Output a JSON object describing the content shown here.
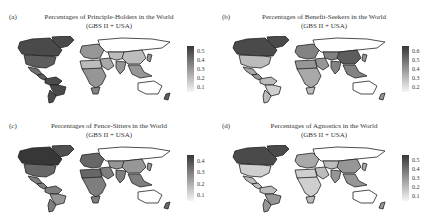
{
  "chart_data": [
    {
      "type": "heatmap",
      "subtype": "choropleth-world-map",
      "panel_label": "(a)",
      "title": "Percentages of Principle-Holders in the World",
      "subtitle": "(GBS II + USA)",
      "colorbar": {
        "ticks": [
          "0.5",
          "0.4",
          "0.3",
          "0.2",
          "0.1"
        ],
        "range": [
          0.05,
          0.55
        ],
        "colormap": "grayscale (light=low, dark=high)"
      },
      "regions": {
        "greenland": 0.5,
        "canada": 0.5,
        "usa": 0.45,
        "mexico": 0.4,
        "central_america": 0.45,
        "south_america_north": 0.5,
        "brazil": 0.5,
        "south_america_south": 0.5,
        "europe": 0.3,
        "russia": null,
        "middle_east": 0.25,
        "north_africa": 0.2,
        "sub_saharan_africa": 0.3,
        "south_africa": 0.35,
        "central_asia": 0.2,
        "china": 0.2,
        "india": 0.3,
        "southeast_asia": 0.3,
        "japan": 0.3,
        "australia": null,
        "new_zealand": 0.45
      }
    },
    {
      "type": "heatmap",
      "subtype": "choropleth-world-map",
      "panel_label": "(b)",
      "title": "Percentages of Benefit-Seekers in the World",
      "subtitle": "(GBS II + USA)",
      "colorbar": {
        "ticks": [
          "0.6",
          "0.5",
          "0.4",
          "0.3",
          "0.2"
        ],
        "range": [
          0.15,
          0.65
        ],
        "colormap": "grayscale (light=low, dark=high)"
      },
      "regions": {
        "greenland": 0.6,
        "canada": 0.6,
        "usa": 0.3,
        "mexico": 0.35,
        "central_america": 0.4,
        "south_america_north": 0.3,
        "brazil": 0.25,
        "south_america_south": 0.3,
        "europe": 0.45,
        "russia": null,
        "middle_east": 0.4,
        "north_africa": 0.4,
        "sub_saharan_africa": 0.35,
        "south_africa": 0.3,
        "central_asia": 0.45,
        "china": 0.55,
        "india": 0.45,
        "southeast_asia": 0.45,
        "japan": 0.4,
        "australia": null,
        "new_zealand": 0.4
      }
    },
    {
      "type": "heatmap",
      "subtype": "choropleth-world-map",
      "panel_label": "(c)",
      "title": "Percentages of Fence-Sitters in the World",
      "subtitle": "(GBS II + USA)",
      "colorbar": {
        "ticks": [
          "0.4",
          "0.3",
          "0.2",
          "0.1"
        ],
        "range": [
          0.05,
          0.45
        ],
        "colormap": "grayscale (light=low, dark=high)"
      },
      "regions": {
        "greenland": 0.4,
        "canada": 0.45,
        "usa": 0.35,
        "mexico": 0.3,
        "central_america": 0.3,
        "south_america_north": 0.3,
        "brazil": 0.25,
        "south_america_south": 0.3,
        "europe": 0.35,
        "russia": null,
        "middle_east": 0.3,
        "north_africa": 0.35,
        "sub_saharan_africa": 0.3,
        "south_africa": 0.3,
        "central_asia": 0.25,
        "china": 0.25,
        "india": 0.3,
        "southeast_asia": 0.3,
        "japan": 0.25,
        "australia": null,
        "new_zealand": 0.35
      }
    },
    {
      "type": "heatmap",
      "subtype": "choropleth-world-map",
      "panel_label": "(d)",
      "title": "Percentages of Agnostics in the World",
      "subtitle": "(GBS II + USA)",
      "colorbar": {
        "ticks": [
          "0.5",
          "0.4",
          "0.3",
          "0.2",
          "0.1"
        ],
        "range": [
          0.05,
          0.55
        ],
        "colormap": "grayscale (light=low, dark=high)"
      },
      "regions": {
        "greenland": 0.5,
        "canada": 0.5,
        "usa": 0.15,
        "mexico": 0.2,
        "central_america": 0.2,
        "south_america_north": 0.2,
        "brazil": 0.3,
        "south_america_south": 0.3,
        "europe": 0.25,
        "russia": null,
        "middle_east": 0.2,
        "north_africa": 0.15,
        "sub_saharan_africa": 0.15,
        "south_africa": 0.2,
        "central_asia": 0.2,
        "china": 0.3,
        "india": 0.3,
        "southeast_asia": 0.3,
        "japan": 0.25,
        "australia": null,
        "new_zealand": 0.3
      }
    }
  ]
}
